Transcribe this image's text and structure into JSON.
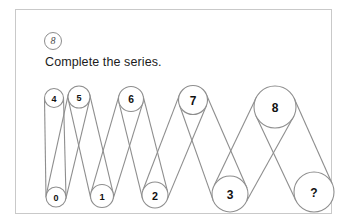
{
  "card": {
    "badge_label": "8",
    "prompt": "Complete the series."
  },
  "colors": {
    "card_border": "#c9c9c9",
    "stroke": "#8e8e8e",
    "text": "#111111",
    "background": "#ffffff"
  },
  "diagram": {
    "type": "series-puzzle",
    "nodes": [
      {
        "label": "0",
        "row": "bottom",
        "cx": 40,
        "cy": 187,
        "r": 10
      },
      {
        "label": "4",
        "row": "top",
        "cx": 38,
        "cy": 88,
        "r": 9.5
      },
      {
        "label": "5",
        "row": "top",
        "cx": 63,
        "cy": 87,
        "r": 11
      },
      {
        "label": "1",
        "row": "bottom",
        "cx": 86,
        "cy": 186,
        "r": 11.5
      },
      {
        "label": "6",
        "row": "top",
        "cx": 115,
        "cy": 89,
        "r": 12.5
      },
      {
        "label": "2",
        "row": "bottom",
        "cx": 139,
        "cy": 185,
        "r": 13
      },
      {
        "label": "7",
        "row": "top",
        "cx": 177,
        "cy": 90,
        "r": 14.5
      },
      {
        "label": "3",
        "row": "bottom",
        "cx": 214,
        "cy": 184,
        "r": 18
      },
      {
        "label": "8",
        "row": "top",
        "cx": 259,
        "cy": 97,
        "r": 21
      },
      {
        "label": "?",
        "row": "bottom",
        "cx": 298,
        "cy": 182,
        "r": 20
      }
    ],
    "links": [
      [
        "4",
        "0"
      ],
      [
        "0",
        "5"
      ],
      [
        "5",
        "1"
      ],
      [
        "1",
        "6"
      ],
      [
        "6",
        "2"
      ],
      [
        "2",
        "7"
      ],
      [
        "7",
        "3"
      ],
      [
        "3",
        "8"
      ],
      [
        "8",
        "?"
      ]
    ],
    "sequence_order": [
      "4",
      "0",
      "5",
      "1",
      "6",
      "2",
      "7",
      "3",
      "8",
      "?"
    ],
    "unknown_label": "?"
  }
}
